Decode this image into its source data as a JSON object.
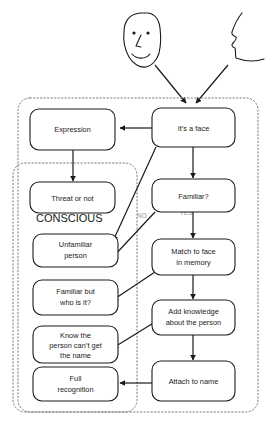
{
  "diagram": {
    "colors": {
      "node_stroke": "#1a1a1a",
      "node_fill": "#ffffff",
      "group_stroke": "#7d7d7d",
      "edge_label": "#9a9a9a",
      "background": "#ffffff"
    },
    "groups": [
      {
        "id": "group-outer",
        "label": ""
      },
      {
        "id": "group-conscious",
        "label": "CONSCIOUS"
      }
    ],
    "group_labels": {
      "conscious": "CONSCIOUS"
    },
    "nodes": [
      {
        "id": "expression",
        "line1": "Expression",
        "line2": "",
        "line3": ""
      },
      {
        "id": "its-a-face",
        "line1": "It’s a face",
        "line2": "",
        "line3": ""
      },
      {
        "id": "threat-or-not",
        "line1": "Threat or not",
        "line2": "",
        "line3": ""
      },
      {
        "id": "familiar",
        "line1": "Familiar?",
        "line2": "",
        "line3": ""
      },
      {
        "id": "unfamiliar-person",
        "line1": "Unfamiliar",
        "line2": "person",
        "line3": ""
      },
      {
        "id": "match-to-face",
        "line1": "Match to face",
        "line2": "in memory",
        "line3": ""
      },
      {
        "id": "familiar-but-who",
        "line1": "Familiar but",
        "line2": "who is it?",
        "line3": ""
      },
      {
        "id": "add-knowledge",
        "line1": "Add knowledge",
        "line2": "about the person",
        "line3": ""
      },
      {
        "id": "know-person-no-name",
        "line1": "Know the",
        "line2": "person can’t get",
        "line3": "the name"
      },
      {
        "id": "full-recognition",
        "line1": "Full",
        "line2": "recognition",
        "line3": ""
      },
      {
        "id": "attach-to-name",
        "line1": "Attach to name",
        "line2": "",
        "line3": ""
      }
    ],
    "edge_labels": {
      "no": "NO",
      "yes": "YES"
    },
    "sketches": [
      {
        "id": "frontal-face-sketch",
        "name": "frontal face drawing"
      },
      {
        "id": "profile-face-sketch",
        "name": "profile face drawing"
      }
    ]
  }
}
